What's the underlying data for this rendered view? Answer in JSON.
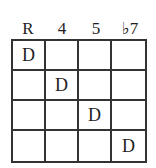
{
  "diagram": {
    "columns": [
      "R",
      "4",
      "5",
      "♭7"
    ],
    "rows": [
      [
        "D",
        "",
        "",
        ""
      ],
      [
        "",
        "D",
        "",
        ""
      ],
      [
        "",
        "",
        "D",
        ""
      ],
      [
        "",
        "",
        "",
        "D"
      ]
    ]
  }
}
